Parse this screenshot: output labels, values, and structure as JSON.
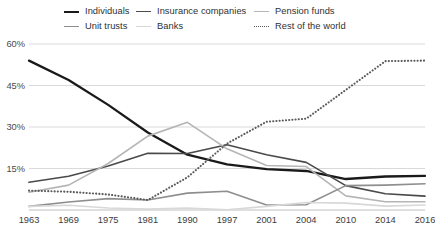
{
  "legend": {
    "items": [
      {
        "label": "Individuals",
        "color": "#1a1a1a",
        "width": 2.3,
        "dash": "none",
        "col": 0,
        "row": 0
      },
      {
        "label": "Insurance companies",
        "color": "#4a4a4a",
        "width": 1.6,
        "dash": "none",
        "col": 1,
        "row": 0
      },
      {
        "label": "Pension funds",
        "color": "#b5b5b5",
        "width": 1.6,
        "dash": "none",
        "col": 2,
        "row": 0
      },
      {
        "label": "Unit trusts",
        "color": "#8e8e8e",
        "width": 1.6,
        "dash": "none",
        "col": 0,
        "row": 1
      },
      {
        "label": "Banks",
        "color": "#d8d8d8",
        "width": 1.6,
        "dash": "none",
        "col": 1,
        "row": 1
      },
      {
        "label": "Rest of the world",
        "color": "#5a5a5a",
        "width": 1.7,
        "dash": "dotted",
        "col": 2,
        "row": 1
      }
    ]
  },
  "axes": {
    "y_ticks": [
      "60%",
      "45%",
      "30%",
      "15%"
    ],
    "y_tick_values": [
      60,
      45,
      30,
      15
    ],
    "x_ticks": [
      "1963",
      "1969",
      "1975",
      "1981",
      "1990",
      "1997",
      "2001",
      "2004",
      "2010",
      "2014",
      "2016"
    ]
  },
  "chart_data": {
    "type": "line",
    "title": "",
    "subtitle": "",
    "xlabel": "",
    "ylabel": "",
    "ylim": [
      0,
      60
    ],
    "grid": true,
    "legend_position": "top",
    "x": [
      "1963",
      "1969",
      "1975",
      "1981",
      "1990",
      "1997",
      "2001",
      "2004",
      "2010",
      "2014",
      "2016"
    ],
    "series": [
      {
        "name": "Individuals",
        "color": "#1a1a1a",
        "width": 2.3,
        "dash": "none",
        "values": [
          54,
          47,
          38,
          28,
          20,
          16.5,
          14.8,
          14.1,
          11.2,
          12.1,
          12.3
        ]
      },
      {
        "name": "Insurance companies",
        "color": "#4a4a4a",
        "width": 1.6,
        "dash": "none",
        "values": [
          10,
          12.2,
          15.9,
          20.5,
          20.4,
          23.6,
          20.0,
          17.2,
          8.8,
          5.9,
          5.0
        ]
      },
      {
        "name": "Pension funds",
        "color": "#b5b5b5",
        "width": 1.6,
        "dash": "none",
        "values": [
          6.4,
          9.0,
          16.8,
          26.7,
          31.7,
          22.1,
          16.1,
          15.7,
          5.1,
          3.0,
          3.0
        ]
      },
      {
        "name": "Unit trusts",
        "color": "#8e8e8e",
        "width": 1.6,
        "dash": "none",
        "values": [
          1.3,
          2.9,
          4.1,
          3.6,
          6.1,
          6.8,
          1.8,
          1.9,
          8.8,
          9.0,
          9.5
        ]
      },
      {
        "name": "Banks",
        "color": "#d8d8d8",
        "width": 1.6,
        "dash": "none",
        "values": [
          1.3,
          1.7,
          0.7,
          0.3,
          0.7,
          0.1,
          1.3,
          2.7,
          2.5,
          1.4,
          1.8
        ]
      },
      {
        "name": "Rest of the world",
        "color": "#5a5a5a",
        "width": 1.7,
        "dash": "dotted",
        "values": [
          7.0,
          6.6,
          5.6,
          3.6,
          11.8,
          24.0,
          31.9,
          33.0,
          43.4,
          53.8,
          54.0
        ]
      }
    ]
  }
}
